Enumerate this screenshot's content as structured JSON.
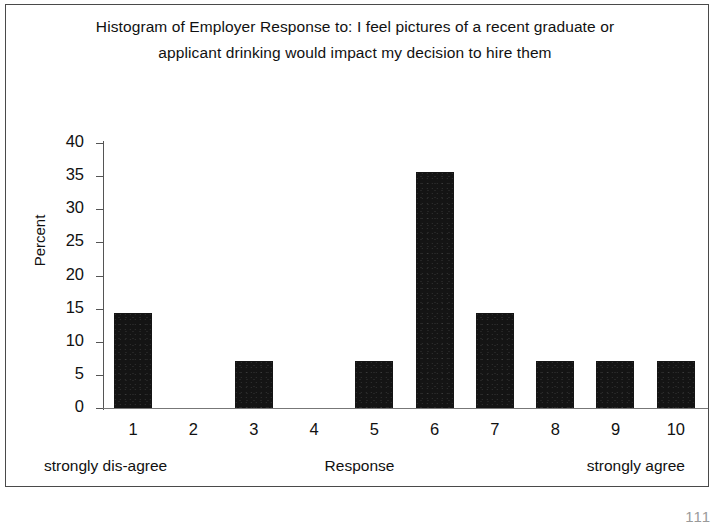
{
  "figure": {
    "title": "Histogram of Employer Response to: I feel pictures of a recent graduate or applicant drinking would impact my decision to hire them",
    "page_number_artifact": "111"
  },
  "chart_data": {
    "type": "bar",
    "title": "Histogram of Employer Response to: I feel pictures of a recent graduate or applicant drinking would impact my decision to hire them",
    "xlabel": "Response",
    "ylabel": "Percent",
    "categories": [
      "1",
      "2",
      "3",
      "4",
      "5",
      "6",
      "7",
      "8",
      "9",
      "10"
    ],
    "values": [
      14.3,
      0,
      7.1,
      0,
      7.1,
      35.7,
      14.3,
      7.1,
      7.1,
      7.1
    ],
    "ylim": [
      0,
      40
    ],
    "yticks": [
      0,
      5,
      10,
      15,
      20,
      25,
      30,
      35,
      40
    ],
    "ytick_labels": [
      "0",
      "5",
      "10",
      "15",
      "20",
      "25",
      "30",
      "35",
      "40"
    ],
    "grid": false,
    "legend": false,
    "bar_color": "#141414",
    "axis_color": "#555555",
    "scale_captions": {
      "low": "strongly dis-agree",
      "axis": "Response",
      "high": "strongly agree"
    }
  }
}
